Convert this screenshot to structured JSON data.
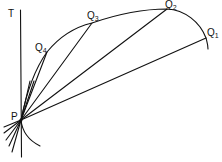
{
  "diagram": {
    "labels": {
      "T": "T",
      "P": "P",
      "Q1": "Q",
      "Q1_sub": "1",
      "Q2": "Q",
      "Q2_sub": "2",
      "Q3": "Q",
      "Q3_sub": "3",
      "Q4": "Q",
      "Q4_sub": "4"
    },
    "points": {
      "P": [
        21,
        120
      ],
      "Q1": [
        206,
        38
      ],
      "Q2": [
        167,
        9
      ],
      "Q3": [
        92,
        23
      ],
      "Q4": [
        47,
        52
      ]
    },
    "colors": {
      "stroke": "#111111",
      "background": "#ffffff"
    }
  }
}
